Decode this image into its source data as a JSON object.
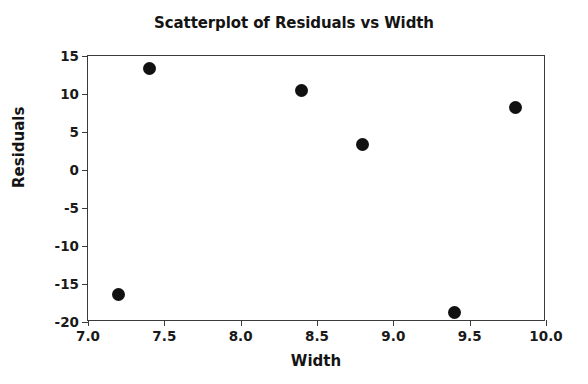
{
  "chart_data": {
    "type": "scatter",
    "title": "Scatterplot of Residuals vs Width",
    "xlabel": "Width",
    "ylabel": "Residuals",
    "xlim": [
      7.0,
      10.0
    ],
    "ylim": [
      -20,
      15
    ],
    "xticks": [
      "7.0",
      "7.5",
      "8.0",
      "8.5",
      "9.0",
      "9.5",
      "10.0"
    ],
    "xtick_values": [
      7.0,
      7.5,
      8.0,
      8.5,
      9.0,
      9.5,
      10.0
    ],
    "yticks": [
      "15",
      "10",
      "5",
      "0",
      "-5",
      "-10",
      "-15",
      "-20"
    ],
    "ytick_values": [
      15,
      10,
      5,
      0,
      -5,
      -10,
      -15,
      -20
    ],
    "grid": false,
    "legend": "none",
    "marker": "filled-circle",
    "marker_color": "#111111",
    "frame_color": "#3a3a3a",
    "background": "#ffffff",
    "x": [
      7.2,
      7.4,
      8.4,
      8.8,
      9.4,
      9.8
    ],
    "y": [
      -16.4,
      13.3,
      10.4,
      3.3,
      -18.8,
      8.2
    ],
    "points": [
      {
        "x": 7.2,
        "y": -16.4
      },
      {
        "x": 7.4,
        "y": 13.3
      },
      {
        "x": 8.4,
        "y": 10.4
      },
      {
        "x": 8.8,
        "y": 3.3
      },
      {
        "x": 9.4,
        "y": -18.8
      },
      {
        "x": 9.8,
        "y": 8.2
      }
    ]
  }
}
